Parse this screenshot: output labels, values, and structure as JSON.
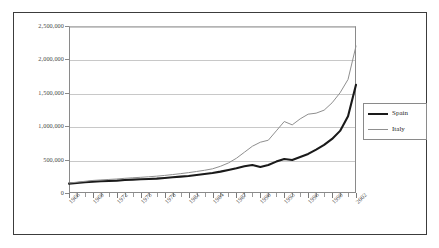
{
  "chart_data": {
    "type": "line",
    "title": "",
    "subtitle": "",
    "xlabel": "",
    "ylabel": "",
    "grid": true,
    "legend_position": "right",
    "xlim": [
      1966,
      2002
    ],
    "ylim": [
      0,
      2500000
    ],
    "ytick_labels": [
      "2,500,000",
      "2,000,000",
      "1,500,000",
      "1,000,000",
      "500,000",
      "0"
    ],
    "ytick_values": [
      2500000,
      2000000,
      1500000,
      1000000,
      500000,
      0
    ],
    "xtick_labels": [
      "1966",
      "1969",
      "1972",
      "1975",
      "1978",
      "1981",
      "1984",
      "1987",
      "1990",
      "1993",
      "1996",
      "1999",
      "2002"
    ],
    "xtick_values": [
      1966,
      1969,
      1972,
      1975,
      1978,
      1981,
      1984,
      1987,
      1990,
      1993,
      1996,
      1999,
      2002
    ],
    "x": [
      1966,
      1967,
      1968,
      1969,
      1970,
      1971,
      1972,
      1973,
      1974,
      1975,
      1976,
      1977,
      1978,
      1979,
      1980,
      1981,
      1982,
      1983,
      1984,
      1985,
      1986,
      1987,
      1988,
      1989,
      1990,
      1991,
      1992,
      1993,
      1994,
      1995,
      1996,
      1997,
      1998,
      1999,
      2000,
      2001,
      2002
    ],
    "series": [
      {
        "name": "Spain",
        "color": "#1a1a1a",
        "width": 2.1,
        "values": [
          140000,
          150000,
          160000,
          170000,
          175000,
          180000,
          185000,
          195000,
          200000,
          205000,
          210000,
          215000,
          225000,
          235000,
          245000,
          255000,
          270000,
          285000,
          300000,
          320000,
          345000,
          370000,
          400000,
          420000,
          390000,
          420000,
          470000,
          510000,
          495000,
          540000,
          585000,
          650000,
          720000,
          810000,
          930000,
          1150000,
          1620000
        ]
      },
      {
        "name": "Italy",
        "color": "#8f8f8f",
        "width": 1.0,
        "values": [
          150000,
          162000,
          175000,
          188000,
          196000,
          203000,
          210000,
          220000,
          228000,
          235000,
          243000,
          252000,
          263000,
          276000,
          290000,
          305000,
          322000,
          340000,
          362000,
          400000,
          450000,
          520000,
          610000,
          700000,
          760000,
          790000,
          930000,
          1070000,
          1020000,
          1110000,
          1180000,
          1195000,
          1240000,
          1350000,
          1500000,
          1700000,
          2200000
        ]
      }
    ]
  },
  "legend": {
    "items": [
      {
        "label": "Spain"
      },
      {
        "label": "Italy"
      }
    ]
  }
}
